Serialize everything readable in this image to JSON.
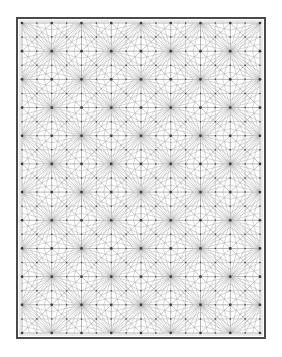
{
  "figure": {
    "caption": "",
    "type": "mesh-diagram",
    "canvas": {
      "width": 282,
      "height": 357,
      "background": "#ffffff"
    },
    "frame": {
      "name": "outer-border",
      "x": 17,
      "y": 18,
      "width": 248,
      "height": 320,
      "stroke": "#4a4a4a",
      "stroke_width": 2.0,
      "fill": "#ffffff",
      "inner_offset": 3,
      "inner_stroke": "#b8b8b8",
      "inner_stroke_width": 0.6
    },
    "mesh": {
      "name": "triangular-mesh",
      "origin_x": 22,
      "origin_y": 23,
      "width": 238,
      "height": 310,
      "columns": 8,
      "rows": 11,
      "cell_width": 29.75,
      "cell_height": 28.18,
      "grid_stroke": "#8c8c8c",
      "grid_stroke_width": 0.65,
      "diagonal_stroke": "#999999",
      "diagonal_stroke_width": 0.55,
      "fan_stroke": "#a6a6a6",
      "fan_stroke_width": 0.45,
      "node_color": "#3d3d3d",
      "major_node_radius": 1.35,
      "minor_node_radius": 0.75,
      "pattern": "quad-grid with both diagonals, edge midpoints, and radial fan subdivision from alternating major nodes",
      "alternation": "fan-refinement applied on cells where (row + col) is even"
    },
    "legend": {
      "visible": false,
      "entries": []
    },
    "axes": {
      "visible": false,
      "xlabel": "",
      "ylabel": ""
    }
  }
}
